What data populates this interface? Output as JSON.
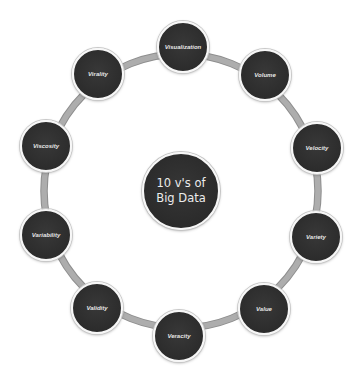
{
  "diagram": {
    "title_lines": [
      "10 v's of",
      "Big Data"
    ],
    "colors": {
      "background": "#ffffff",
      "node_fill": "#2e2e2e",
      "node_border": "#f7f7f7",
      "ring_stroke": "#a6a6a6",
      "label_text": "#e6e6e6"
    },
    "nodes": [
      {
        "label": "Visualization",
        "x": 183,
        "y": 47
      },
      {
        "label": "Volume",
        "x": 265,
        "y": 75
      },
      {
        "label": "Velocity",
        "x": 317,
        "y": 148
      },
      {
        "label": "Variety",
        "x": 316,
        "y": 237
      },
      {
        "label": "Value",
        "x": 264,
        "y": 309
      },
      {
        "label": "Veracity",
        "x": 179,
        "y": 336
      },
      {
        "label": "Validity",
        "x": 97,
        "y": 308
      },
      {
        "label": "Variability",
        "x": 46,
        "y": 235
      },
      {
        "label": "Viscosity",
        "x": 46,
        "y": 146
      },
      {
        "label": "Virality",
        "x": 98,
        "y": 74
      }
    ]
  }
}
